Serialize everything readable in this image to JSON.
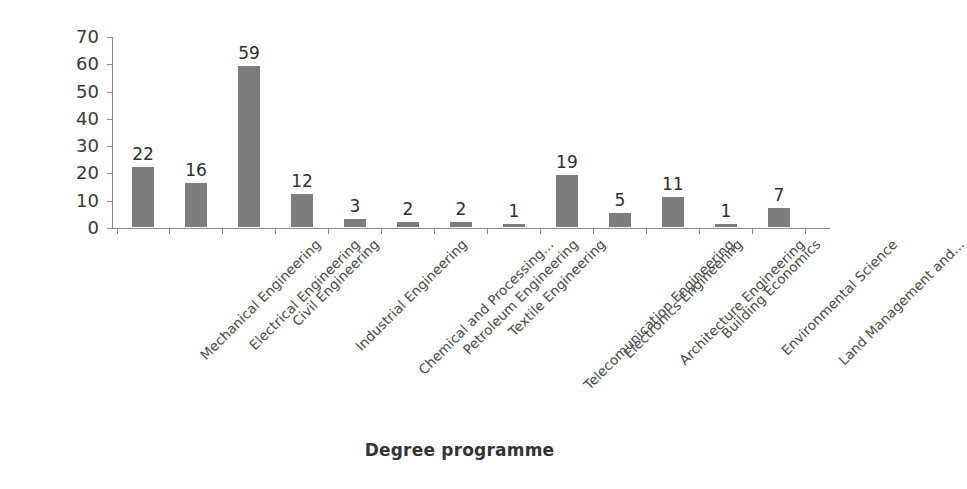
{
  "chart_data": {
    "type": "bar",
    "title": "",
    "xlabel": "Degree programme",
    "ylabel": "Frequency",
    "ylim": [
      0,
      70
    ],
    "yticks": [
      0,
      10,
      20,
      30,
      40,
      50,
      60,
      70
    ],
    "grid": false,
    "legend": null,
    "bar_color": "#7d7d7d",
    "axis_color": "#8a8a8a",
    "categories": [
      "Mechanical Engineering",
      "Electrical Engineering",
      "Civil Engineering",
      "Industrial Engineering",
      "Chemical and Processing...",
      "Petroleum Engineering",
      "Textile Engineering",
      "Telecomunication Engineering",
      "Electronics Engineering",
      "Architecture Engineering",
      "Building Economics",
      "Environmental Science",
      "Land Management and..."
    ],
    "values": [
      22,
      16,
      59,
      12,
      3,
      2,
      2,
      1,
      19,
      5,
      11,
      1,
      7
    ],
    "data_labels": [
      "22",
      "16",
      "59",
      "12",
      "3",
      "2",
      "2",
      "1",
      "19",
      "5",
      "11",
      "1",
      "7"
    ]
  }
}
